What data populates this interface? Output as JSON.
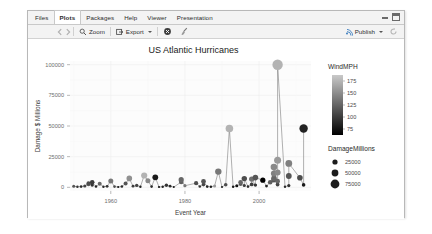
{
  "window": {
    "tabs": [
      {
        "label": "Files",
        "active": false
      },
      {
        "label": "Plots",
        "active": true
      },
      {
        "label": "Packages",
        "active": false
      },
      {
        "label": "Help",
        "active": false
      },
      {
        "label": "Viewer",
        "active": false
      },
      {
        "label": "Presentation",
        "active": false
      }
    ],
    "controls": {
      "minimize": "minimize-window",
      "maximize": "maximize-window"
    }
  },
  "toolbar": {
    "back_icon": "back-arrow-icon",
    "forward_icon": "forward-arrow-icon",
    "zoom_label": "Zoom",
    "zoom_icon": "magnifier-icon",
    "export_label": "Export",
    "export_icon": "export-icon",
    "export_caret": "chevron-down-icon",
    "remove_plot_icon": "remove-plot-icon",
    "clear_plots_icon": "broom-icon",
    "publish_label": "Publish",
    "publish_icon": "publish-icon",
    "publish_caret": "chevron-down-icon",
    "refresh_icon": "refresh-icon"
  },
  "chart_data": {
    "type": "scatter",
    "title": "US Atlantic Hurricanes",
    "xlabel": "Event Year",
    "ylabel": "Damage $ Millions",
    "xlim": [
      1949,
      2014
    ],
    "ylim": [
      -3000,
      103000
    ],
    "xticks": [
      1960,
      1980,
      2000
    ],
    "yticks": [
      0,
      25000,
      50000,
      75000,
      100000
    ],
    "ytick_labels": [
      "0",
      "25000",
      "50000",
      "75000",
      "100000"
    ],
    "xtick_labels": [
      "1960",
      "1980",
      "2000"
    ],
    "grid": true,
    "lines": true,
    "legends": [
      {
        "title": "WindMPH",
        "type": "colorbar",
        "ticks": [
          175,
          150,
          125,
          100,
          75
        ],
        "tick_labels": [
          "175",
          "150",
          "125",
          "100",
          "75"
        ],
        "gradient_top": "#c9c9c9",
        "gradient_bottom": "#000000",
        "range": [
          70,
          190
        ]
      },
      {
        "title": "DamageMillions",
        "type": "size",
        "ticks": [
          25000,
          50000,
          75000
        ],
        "tick_labels": [
          "25000",
          "50000",
          "75000"
        ],
        "sizes": [
          2.6,
          3.4,
          4.4
        ]
      }
    ],
    "points": [
      {
        "x": 1950,
        "y": 900,
        "wind": 120,
        "size": 1.5
      },
      {
        "x": 1951,
        "y": 400,
        "wind": 100,
        "size": 1.2
      },
      {
        "x": 1952,
        "y": 600,
        "wind": 95,
        "size": 1.3
      },
      {
        "x": 1953,
        "y": 1100,
        "wind": 110,
        "size": 1.6
      },
      {
        "x": 1954,
        "y": 2500,
        "wind": 125,
        "size": 1.9
      },
      {
        "x": 1954,
        "y": 3200,
        "wind": 115,
        "size": 2.1
      },
      {
        "x": 1955,
        "y": 4100,
        "wind": 105,
        "size": 2.3
      },
      {
        "x": 1955,
        "y": 1800,
        "wind": 100,
        "size": 1.7
      },
      {
        "x": 1956,
        "y": 700,
        "wind": 90,
        "size": 1.3
      },
      {
        "x": 1957,
        "y": 2900,
        "wind": 130,
        "size": 2.0
      },
      {
        "x": 1958,
        "y": 500,
        "wind": 95,
        "size": 1.2
      },
      {
        "x": 1959,
        "y": 800,
        "wind": 100,
        "size": 1.4
      },
      {
        "x": 1960,
        "y": 5200,
        "wind": 140,
        "size": 2.5
      },
      {
        "x": 1961,
        "y": 600,
        "wind": 115,
        "size": 1.3
      },
      {
        "x": 1962,
        "y": 300,
        "wind": 85,
        "size": 1.1
      },
      {
        "x": 1963,
        "y": 700,
        "wind": 95,
        "size": 1.3
      },
      {
        "x": 1964,
        "y": 3100,
        "wind": 120,
        "size": 2.0
      },
      {
        "x": 1965,
        "y": 7300,
        "wind": 155,
        "size": 2.8
      },
      {
        "x": 1966,
        "y": 900,
        "wind": 105,
        "size": 1.4
      },
      {
        "x": 1967,
        "y": 1600,
        "wind": 110,
        "size": 1.7
      },
      {
        "x": 1968,
        "y": 400,
        "wind": 90,
        "size": 1.2
      },
      {
        "x": 1969,
        "y": 9600,
        "wind": 175,
        "size": 3.1
      },
      {
        "x": 1970,
        "y": 5400,
        "wind": 150,
        "size": 2.5
      },
      {
        "x": 1971,
        "y": 600,
        "wind": 95,
        "size": 1.3
      },
      {
        "x": 1972,
        "y": 8200,
        "wind": 85,
        "size": 2.9
      },
      {
        "x": 1973,
        "y": 300,
        "wind": 80,
        "size": 1.1
      },
      {
        "x": 1974,
        "y": 500,
        "wind": 90,
        "size": 1.2
      },
      {
        "x": 1975,
        "y": 1700,
        "wind": 100,
        "size": 1.7
      },
      {
        "x": 1976,
        "y": 900,
        "wind": 95,
        "size": 1.4
      },
      {
        "x": 1977,
        "y": 200,
        "wind": 85,
        "size": 1.0
      },
      {
        "x": 1979,
        "y": 6200,
        "wind": 130,
        "size": 2.6
      },
      {
        "x": 1979,
        "y": 4300,
        "wind": 125,
        "size": 2.3
      },
      {
        "x": 1980,
        "y": 1300,
        "wind": 140,
        "size": 1.6
      },
      {
        "x": 1983,
        "y": 3400,
        "wind": 115,
        "size": 2.1
      },
      {
        "x": 1984,
        "y": 700,
        "wind": 100,
        "size": 1.3
      },
      {
        "x": 1985,
        "y": 4800,
        "wind": 120,
        "size": 2.4
      },
      {
        "x": 1985,
        "y": 2200,
        "wind": 110,
        "size": 1.8
      },
      {
        "x": 1986,
        "y": 600,
        "wind": 90,
        "size": 1.3
      },
      {
        "x": 1987,
        "y": 400,
        "wind": 85,
        "size": 1.2
      },
      {
        "x": 1988,
        "y": 1100,
        "wind": 160,
        "size": 1.5
      },
      {
        "x": 1989,
        "y": 12800,
        "wind": 140,
        "size": 3.2
      },
      {
        "x": 1990,
        "y": 300,
        "wind": 90,
        "size": 1.1
      },
      {
        "x": 1991,
        "y": 2100,
        "wind": 115,
        "size": 1.8
      },
      {
        "x": 1992,
        "y": 48000,
        "wind": 175,
        "size": 3.8
      },
      {
        "x": 1993,
        "y": 400,
        "wind": 85,
        "size": 1.2
      },
      {
        "x": 1994,
        "y": 1200,
        "wind": 80,
        "size": 1.5
      },
      {
        "x": 1995,
        "y": 4100,
        "wind": 130,
        "size": 2.3
      },
      {
        "x": 1995,
        "y": 2700,
        "wind": 120,
        "size": 1.9
      },
      {
        "x": 1996,
        "y": 7100,
        "wind": 115,
        "size": 2.7
      },
      {
        "x": 1996,
        "y": 1500,
        "wind": 105,
        "size": 1.6
      },
      {
        "x": 1997,
        "y": 600,
        "wind": 95,
        "size": 1.3
      },
      {
        "x": 1998,
        "y": 6700,
        "wind": 135,
        "size": 2.7
      },
      {
        "x": 1998,
        "y": 2400,
        "wind": 105,
        "size": 1.9
      },
      {
        "x": 1999,
        "y": 7900,
        "wind": 120,
        "size": 2.8
      },
      {
        "x": 1999,
        "y": 1800,
        "wind": 100,
        "size": 1.7
      },
      {
        "x": 2001,
        "y": 5800,
        "wind": 70,
        "size": 2.6
      },
      {
        "x": 2002,
        "y": 1000,
        "wind": 90,
        "size": 1.4
      },
      {
        "x": 2003,
        "y": 4200,
        "wind": 125,
        "size": 2.3
      },
      {
        "x": 2004,
        "y": 16500,
        "wind": 150,
        "size": 3.3
      },
      {
        "x": 2004,
        "y": 11200,
        "wind": 145,
        "size": 3.0
      },
      {
        "x": 2004,
        "y": 7400,
        "wind": 130,
        "size": 2.7
      },
      {
        "x": 2004,
        "y": 6100,
        "wind": 120,
        "size": 2.6
      },
      {
        "x": 2005,
        "y": 100000,
        "wind": 175,
        "size": 5.2
      },
      {
        "x": 2005,
        "y": 22000,
        "wind": 160,
        "size": 3.5
      },
      {
        "x": 2005,
        "y": 12000,
        "wind": 150,
        "size": 3.0
      },
      {
        "x": 2005,
        "y": 5000,
        "wind": 130,
        "size": 2.4
      },
      {
        "x": 2005,
        "y": 2300,
        "wind": 110,
        "size": 1.9
      },
      {
        "x": 2007,
        "y": 500,
        "wind": 95,
        "size": 1.2
      },
      {
        "x": 2008,
        "y": 19500,
        "wind": 145,
        "size": 3.4
      },
      {
        "x": 2008,
        "y": 9200,
        "wind": 120,
        "size": 2.9
      },
      {
        "x": 2008,
        "y": 1400,
        "wind": 100,
        "size": 1.6
      },
      {
        "x": 2011,
        "y": 7800,
        "wind": 115,
        "size": 2.8
      },
      {
        "x": 2012,
        "y": 48000,
        "wind": 90,
        "size": 4.2
      },
      {
        "x": 2012,
        "y": 2000,
        "wind": 85,
        "size": 1.8
      }
    ]
  }
}
